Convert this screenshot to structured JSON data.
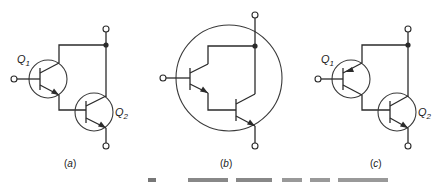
{
  "figure": {
    "panels": [
      {
        "id": "a",
        "caption": "(a)",
        "caption_letter": "a",
        "transistors": [
          {
            "label": "Q",
            "subscript": "1",
            "type": "npn"
          },
          {
            "label": "Q",
            "subscript": "2",
            "type": "npn"
          }
        ],
        "description": "Discrete Darlington pair: two NPN transistors, Q1 emitter drives Q2 base, collectors joined"
      },
      {
        "id": "b",
        "caption": "(b)",
        "caption_letter": "b",
        "transistors": [
          {
            "label": "",
            "subscript": "",
            "type": "npn"
          },
          {
            "label": "",
            "subscript": "",
            "type": "npn"
          }
        ],
        "description": "Monolithic Darlington: both NPN transistors inside a single package circle"
      },
      {
        "id": "c",
        "caption": "(c)",
        "caption_letter": "c",
        "transistors": [
          {
            "label": "Q",
            "subscript": "1",
            "type": "pnp"
          },
          {
            "label": "Q",
            "subscript": "2",
            "type": "npn"
          }
        ],
        "description": "Complementary (Sziklai) variant: PNP Q1 with NPN Q2"
      }
    ],
    "colors": {
      "line": "#2b2b2b",
      "background": "#ffffff"
    }
  }
}
